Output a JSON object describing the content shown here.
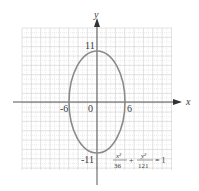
{
  "diagram": {
    "type": "ellipse-graph",
    "axes": {
      "x_label": "x",
      "y_label": "y"
    },
    "ticks": {
      "x_neg": "-6",
      "origin": "0",
      "x_pos": "6",
      "y_pos": "11",
      "y_neg": "-11"
    },
    "equation": {
      "term1_num": "x²",
      "term1_den": "36",
      "plus": "+",
      "term2_num": "y²",
      "term2_den": "121",
      "equals": "= 1"
    },
    "ellipse": {
      "center": [
        0,
        0
      ],
      "semi_x": 6,
      "semi_y": 11
    },
    "colors": {
      "curve": "#8a8a8a",
      "axis": "#555555",
      "grid": "#d8d8d8",
      "grid_major": "#c4c4c4"
    }
  }
}
